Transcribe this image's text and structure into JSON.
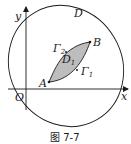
{
  "figure": {
    "caption": "图 7-7",
    "labels": {
      "y_axis": "y",
      "x_axis": "x",
      "origin": "O",
      "region_outer": "D",
      "region_inner": "D",
      "region_inner_sub": "1",
      "point_a": "A",
      "point_b": "B",
      "curve_1": "Γ",
      "curve_1_sub": "1",
      "curve_2": "Γ",
      "curve_2_sub": "2"
    },
    "colors": {
      "stroke": "#1a1a1a",
      "shaded_region": "#bdbdbd",
      "background": "#ffffff"
    }
  }
}
